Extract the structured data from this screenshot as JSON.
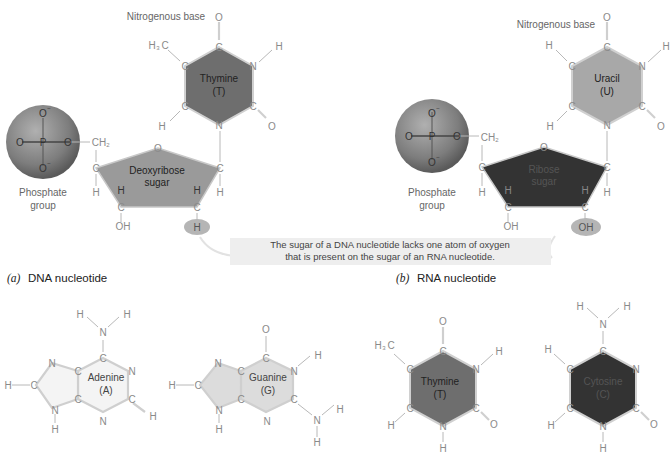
{
  "panels": {
    "dna": {
      "letter": "(a)",
      "title": "DNA nucleotide",
      "base_caption": "Nitrogenous base",
      "base_name": "Thymine",
      "base_abbr": "(T)",
      "sugar_line1": "Deoxyribose",
      "sugar_line2": "sugar",
      "phosphate_line1": "Phosphate",
      "phosphate_line2": "group",
      "highlight_atom": "H",
      "colors": {
        "base": "#6e6e6e",
        "sugar": "#9a9a9a",
        "phosphate": "#8a8a8a"
      }
    },
    "rna": {
      "letter": "(b)",
      "title": "RNA nucleotide",
      "base_caption": "Nitrogenous base",
      "base_name": "Uracil",
      "base_abbr": "(U)",
      "sugar_line1": "Ribose",
      "sugar_line2": "sugar",
      "phosphate_line1": "Phosphate",
      "phosphate_line2": "group",
      "highlight_atom": "OH",
      "colors": {
        "base": "#a8a8a8",
        "sugar": "#333333",
        "phosphate": "#8a8a8a"
      }
    }
  },
  "callout": {
    "line1": "The sugar of a DNA nucleotide lacks one atom of oxygen",
    "line2": "that is present on the sugar of an RNA nucleotide."
  },
  "bases": [
    {
      "name": "Adenine",
      "abbr": "(A)",
      "color": "#f4f4f4"
    },
    {
      "name": "Guanine",
      "abbr": "(G)",
      "color": "#dcdcdc"
    },
    {
      "name": "Thymine",
      "abbr": "(T)",
      "color": "#6e6e6e"
    },
    {
      "name": "Cytosine",
      "abbr": "(C)",
      "color": "#333333"
    }
  ],
  "atoms": {
    "O": "O",
    "C": "C",
    "N": "N",
    "H": "H",
    "P": "P",
    "OH": "OH",
    "CH2": "CH",
    "H3C": "H",
    "sub2": "2",
    "sub3": "3",
    "C3tail": "C",
    "minus": "−"
  }
}
